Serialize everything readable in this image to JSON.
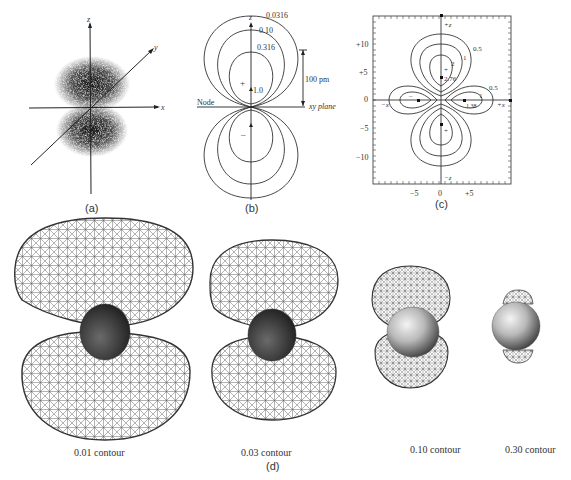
{
  "figure": {
    "panel_a": {
      "caption": "(a)",
      "axis_labels": {
        "z": "z",
        "y": "y",
        "x": "x"
      }
    },
    "panel_b": {
      "caption": "(b)",
      "axis_label_z": "z",
      "contours": [
        "0.0316",
        "0.10",
        "0.316",
        "1.0"
      ],
      "plus_sign": "+",
      "minus_sign": "–",
      "scale_bar": "100 pm",
      "node_label": "Node",
      "plane_label": "xy plane"
    },
    "panel_c": {
      "caption": "(c)",
      "y_ticks": [
        "+10",
        "+5",
        "0",
        "−5",
        "−10"
      ],
      "x_ticks": [
        "−5",
        "0",
        "+5"
      ],
      "axis_labels": {
        "pz": "+z",
        "nz": "−z",
        "px": "+x",
        "nx": "−x"
      },
      "contour_labels": {
        "upper_outer": "0.5",
        "upper_mid": "1",
        "upper_inner": "2",
        "upper_peak": "2.76",
        "right_outer": "0.5",
        "right_mid": "1",
        "right_peak": "1.38"
      },
      "signs": {
        "upper": "+",
        "lower": "+",
        "left": "–",
        "right": "–"
      }
    },
    "panel_d": {
      "caption": "(d)",
      "isosurfaces": [
        {
          "label": "0.01 contour"
        },
        {
          "label": "0.03 contour"
        },
        {
          "label": "0.10 contour"
        },
        {
          "label": "0.30 contour"
        }
      ]
    }
  },
  "colors": {
    "ink": "#222222",
    "wire": "#555555",
    "background": "#ffffff"
  }
}
